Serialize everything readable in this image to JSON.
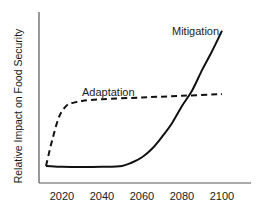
{
  "chart_data": {
    "type": "line",
    "title": "",
    "xlabel": "",
    "ylabel": "Relative Impact on Food Security",
    "x_ticks": [
      "2020",
      "2040",
      "2060",
      "2080",
      "2100"
    ],
    "xlim": [
      2008,
      2115
    ],
    "ylim": [
      0,
      100
    ],
    "grid": false,
    "legend": "inline labels",
    "series": [
      {
        "name": "Mitigation",
        "style": "solid",
        "color": "#111111",
        "label_position": {
          "x": 2091,
          "y": 88
        },
        "x": [
          2012,
          2020,
          2030,
          2040,
          2050,
          2055,
          2060,
          2065,
          2070,
          2075,
          2080,
          2085,
          2090,
          2095,
          2100
        ],
        "values": [
          10,
          9.5,
          9.3,
          9.5,
          10,
          12,
          15,
          20,
          27,
          35,
          45,
          54,
          66,
          77,
          89
        ]
      },
      {
        "name": "Adaptation",
        "style": "dashed",
        "color": "#111111",
        "label_position": {
          "x": 2038,
          "y": 53
        },
        "x": [
          2012,
          2014,
          2016,
          2018,
          2020,
          2023,
          2026,
          2030,
          2040,
          2060,
          2080,
          2100
        ],
        "values": [
          10,
          20,
          29,
          37,
          42,
          46,
          47,
          48,
          49,
          50,
          51,
          52
        ]
      }
    ]
  },
  "labels": {
    "ylabel": "Relative Impact on Food Security",
    "mitigation": "Mitigation",
    "adaptation": "Adaptation",
    "ticks": [
      "2020",
      "2040",
      "2060",
      "2080",
      "2100"
    ]
  }
}
